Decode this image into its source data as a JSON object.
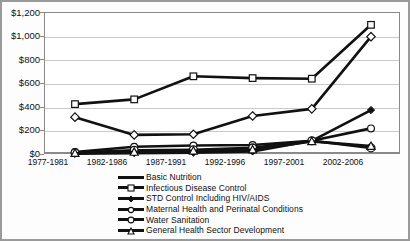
{
  "chart_data": {
    "type": "line",
    "title": "",
    "xlabel": "",
    "ylabel": "",
    "categories": [
      "1977-1981",
      "1982-1986",
      "1987-1991",
      "1992-1996",
      "1997-2001",
      "2002-2006"
    ],
    "ylim": [
      0,
      1200
    ],
    "ytick_labels": [
      "$0",
      "$200",
      "$400",
      "$600",
      "$800",
      "$1,000",
      "$1,200"
    ],
    "ytick_values": [
      0,
      200,
      400,
      600,
      800,
      1000,
      1200
    ],
    "grid": true,
    "legend_position": "bottom",
    "series": [
      {
        "name": "Basic Nutrition",
        "marker": "diamond",
        "values": [
          320,
          170,
          175,
          330,
          390,
          1000
        ]
      },
      {
        "name": "Infectious Disease Control",
        "marker": "square",
        "values": [
          430,
          470,
          665,
          650,
          645,
          1100
        ]
      },
      {
        "name": "STD Control Including HIV/AIDS",
        "marker": "diamond-filled",
        "values": [
          10,
          15,
          20,
          30,
          120,
          380
        ]
      },
      {
        "name": "Maternal Health and Perinatal Conditions",
        "marker": "circle",
        "values": [
          25,
          70,
          80,
          85,
          120,
          225
        ]
      },
      {
        "name": "Water Sanitation",
        "marker": "circle-open",
        "values": [
          20,
          40,
          45,
          60,
          120,
          60
        ]
      },
      {
        "name": "General Health Sector Development",
        "marker": "triangle",
        "values": [
          15,
          25,
          35,
          45,
          115,
          75
        ]
      }
    ]
  },
  "axis": {
    "y_tick_0": "$0",
    "y_tick_1": "$200",
    "y_tick_2": "$400",
    "y_tick_3": "$600",
    "y_tick_4": "$800",
    "y_tick_5": "$1,000",
    "y_tick_6": "$1,200"
  },
  "xaxis": {
    "t0": "1977-1981",
    "t1": "1982-1986",
    "t2": "1987-1991",
    "t3": "1992-1996",
    "t4": "1997-2001",
    "t5": "2002-2006"
  },
  "legend": {
    "l0": "Basic Nutrition",
    "l1": "Infectious Disease Control",
    "l2": "STD Control Including HIV/AIDS",
    "l3": "Maternal Health and Perinatal Conditions",
    "l4": "Water Sanitation",
    "l5": "General Health Sector Development"
  },
  "colors": {
    "line": "#111111",
    "grid": "#c9c9c9",
    "axis": "#8a8a8a",
    "background": "#ffffff"
  }
}
